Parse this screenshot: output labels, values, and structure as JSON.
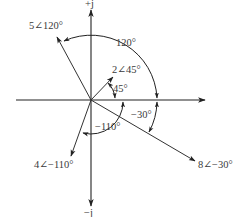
{
  "diagram": {
    "type": "phasor-diagram",
    "origin_px": [
      91,
      100
    ],
    "axes": {
      "real_axis": {
        "label": ""
      },
      "imag_pos_label": "+j",
      "imag_neg_label": "−j"
    },
    "phasors": [
      {
        "id": "p1",
        "magnitude": 5,
        "angle_deg": 120,
        "label": "5∠120°"
      },
      {
        "id": "p2",
        "magnitude": 2,
        "angle_deg": 45,
        "label": "2∠45°"
      },
      {
        "id": "p3",
        "magnitude": 4,
        "angle_deg": -110,
        "label": "4∠−110°"
      },
      {
        "id": "p4",
        "magnitude": 8,
        "angle_deg": -30,
        "label": "8∠−30°"
      }
    ],
    "angle_arcs": [
      {
        "for": "p1",
        "label": "120°"
      },
      {
        "for": "p2",
        "label": "45°"
      },
      {
        "for": "p3",
        "label": "−110°"
      },
      {
        "for": "p4",
        "label": "−30°"
      }
    ]
  }
}
